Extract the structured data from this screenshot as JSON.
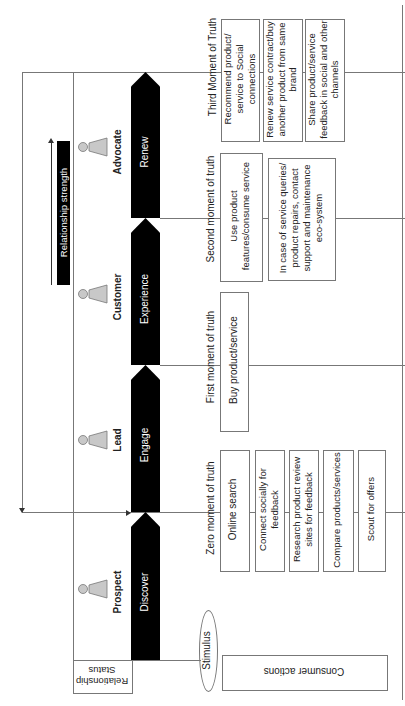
{
  "relationship_status_label": "Relationship Status",
  "relationship_strength_label": "Relationship strength",
  "stimulus_label": "Stimulus",
  "consumer_actions_label": "Consumer actions",
  "stages": [
    {
      "status": "Prospect",
      "action": "Discover"
    },
    {
      "status": "Lead",
      "action": "Engage"
    },
    {
      "status": "Customer",
      "action": "Experience"
    },
    {
      "status": "Advocate",
      "action": "Renew"
    }
  ],
  "moments": [
    {
      "title": "Zero moment of truth",
      "items": [
        "Online search",
        "Connect socially for feedback",
        "Research product review sites for feedback",
        "Compare products/services",
        "Scout for offers"
      ]
    },
    {
      "title": "First moment of truth",
      "items": [
        "Buy product/service"
      ]
    },
    {
      "title": "Second moment of truth",
      "items": [
        "Use  product features/consume service",
        "In case of service queries/ product repairs, contact support and maintenance eco-system"
      ]
    },
    {
      "title": "Third Moment of Truth",
      "items": [
        "Recommend product/ service to Social connections",
        "Renew service contract/buy another product from same brand",
        "Share product/service feedback in social and other channels"
      ]
    }
  ],
  "colors": {
    "arrow": "#000000",
    "line": "#777777",
    "person_fill": "#c8c8c8"
  }
}
